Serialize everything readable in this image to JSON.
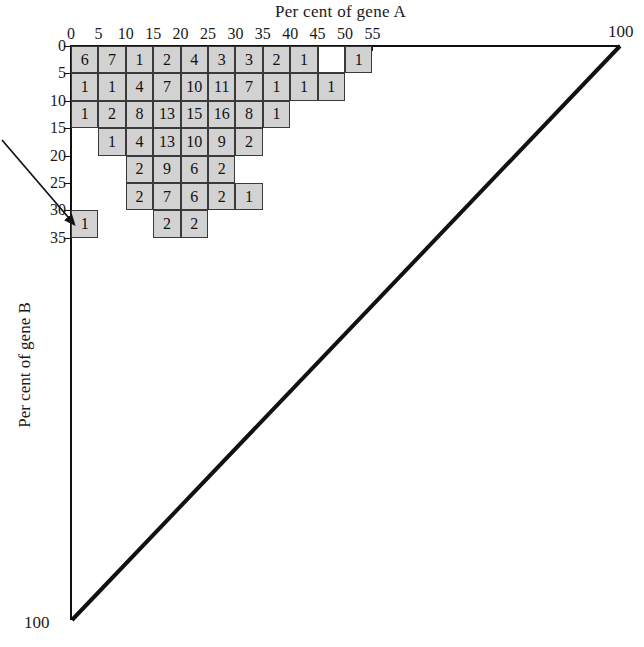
{
  "figure": {
    "x_axis_title": "Per cent of gene A",
    "y_axis_title": "Per cent of gene B",
    "corner_label_right": "100",
    "corner_label_bottom": "100"
  },
  "chart_data": {
    "type": "heatmap",
    "title": "",
    "xlabel": "Per cent of gene A",
    "ylabel": "Per cent of gene B",
    "xlim": [
      0,
      100
    ],
    "ylim": [
      0,
      100
    ],
    "grid": true,
    "legend": "none",
    "bin_size": 5,
    "x_ticks": [
      "0",
      "5",
      "10",
      "15",
      "20",
      "25",
      "30",
      "35",
      "40",
      "45",
      "50",
      "55"
    ],
    "x_tick_values": [
      0,
      5,
      10,
      15,
      20,
      25,
      30,
      35,
      40,
      45,
      50,
      55
    ],
    "y_ticks": [
      "0",
      "5",
      "10",
      "15",
      "20",
      "25",
      "30",
      "35"
    ],
    "y_tick_values": [
      0,
      5,
      10,
      15,
      20,
      25,
      30,
      35
    ],
    "corner_ticks": {
      "x_max": "100",
      "y_max": "100"
    },
    "cell_fill_color": "#d2d2d2",
    "cell_border_color": "#3a3a3a",
    "line_color": "#111111",
    "cells": [
      {
        "x": 0,
        "y": 0,
        "value": "6"
      },
      {
        "x": 5,
        "y": 0,
        "value": "7"
      },
      {
        "x": 10,
        "y": 0,
        "value": "1"
      },
      {
        "x": 15,
        "y": 0,
        "value": "2"
      },
      {
        "x": 20,
        "y": 0,
        "value": "4"
      },
      {
        "x": 25,
        "y": 0,
        "value": "3"
      },
      {
        "x": 30,
        "y": 0,
        "value": "3"
      },
      {
        "x": 35,
        "y": 0,
        "value": "2"
      },
      {
        "x": 40,
        "y": 0,
        "value": "1"
      },
      {
        "x": 45,
        "y": 0,
        "value": "",
        "empty": true
      },
      {
        "x": 50,
        "y": 0,
        "value": "1"
      },
      {
        "x": 0,
        "y": 5,
        "value": "1"
      },
      {
        "x": 5,
        "y": 5,
        "value": "1"
      },
      {
        "x": 10,
        "y": 5,
        "value": "4"
      },
      {
        "x": 15,
        "y": 5,
        "value": "7"
      },
      {
        "x": 20,
        "y": 5,
        "value": "10"
      },
      {
        "x": 25,
        "y": 5,
        "value": "11"
      },
      {
        "x": 30,
        "y": 5,
        "value": "7"
      },
      {
        "x": 35,
        "y": 5,
        "value": "1"
      },
      {
        "x": 40,
        "y": 5,
        "value": "1"
      },
      {
        "x": 45,
        "y": 5,
        "value": "1"
      },
      {
        "x": 0,
        "y": 10,
        "value": "1"
      },
      {
        "x": 5,
        "y": 10,
        "value": "2"
      },
      {
        "x": 10,
        "y": 10,
        "value": "8"
      },
      {
        "x": 15,
        "y": 10,
        "value": "13"
      },
      {
        "x": 20,
        "y": 10,
        "value": "15"
      },
      {
        "x": 25,
        "y": 10,
        "value": "16"
      },
      {
        "x": 30,
        "y": 10,
        "value": "8"
      },
      {
        "x": 35,
        "y": 10,
        "value": "1"
      },
      {
        "x": 5,
        "y": 15,
        "value": "1"
      },
      {
        "x": 10,
        "y": 15,
        "value": "4"
      },
      {
        "x": 15,
        "y": 15,
        "value": "13"
      },
      {
        "x": 20,
        "y": 15,
        "value": "10"
      },
      {
        "x": 25,
        "y": 15,
        "value": "9"
      },
      {
        "x": 30,
        "y": 15,
        "value": "2"
      },
      {
        "x": 10,
        "y": 20,
        "value": "2"
      },
      {
        "x": 15,
        "y": 20,
        "value": "9"
      },
      {
        "x": 20,
        "y": 20,
        "value": "6"
      },
      {
        "x": 25,
        "y": 20,
        "value": "2"
      },
      {
        "x": 10,
        "y": 25,
        "value": "2"
      },
      {
        "x": 15,
        "y": 25,
        "value": "7"
      },
      {
        "x": 20,
        "y": 25,
        "value": "6"
      },
      {
        "x": 25,
        "y": 25,
        "value": "2"
      },
      {
        "x": 30,
        "y": 25,
        "value": "1"
      },
      {
        "x": 0,
        "y": 30,
        "value": "1"
      },
      {
        "x": 15,
        "y": 30,
        "value": "2"
      },
      {
        "x": 20,
        "y": 30,
        "value": "2"
      }
    ],
    "annotations": [
      {
        "type": "arrow",
        "target_x": 0,
        "target_y": 30,
        "description": "arrow pointing to the isolated cell at gene A 0-5 per cent, gene B 30-35 per cent"
      }
    ],
    "reference_line": {
      "description": "diagonal boundary from (0,100) to (100,0)",
      "from": [
        0,
        100
      ],
      "to": [
        100,
        0
      ]
    }
  }
}
